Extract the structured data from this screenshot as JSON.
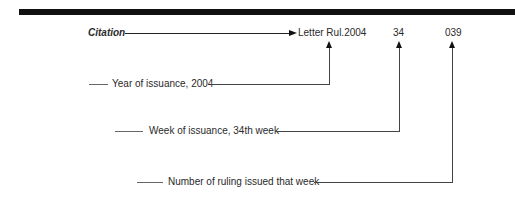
{
  "citation": {
    "label": "Citation",
    "parts": {
      "prefix": "Letter Rul.2004",
      "week": "34",
      "number": "039"
    }
  },
  "annotations": [
    {
      "label": "Year of issuance, 2004"
    },
    {
      "label": "Week of issuance, 34th week"
    },
    {
      "label": "Number of ruling issued that week"
    }
  ]
}
